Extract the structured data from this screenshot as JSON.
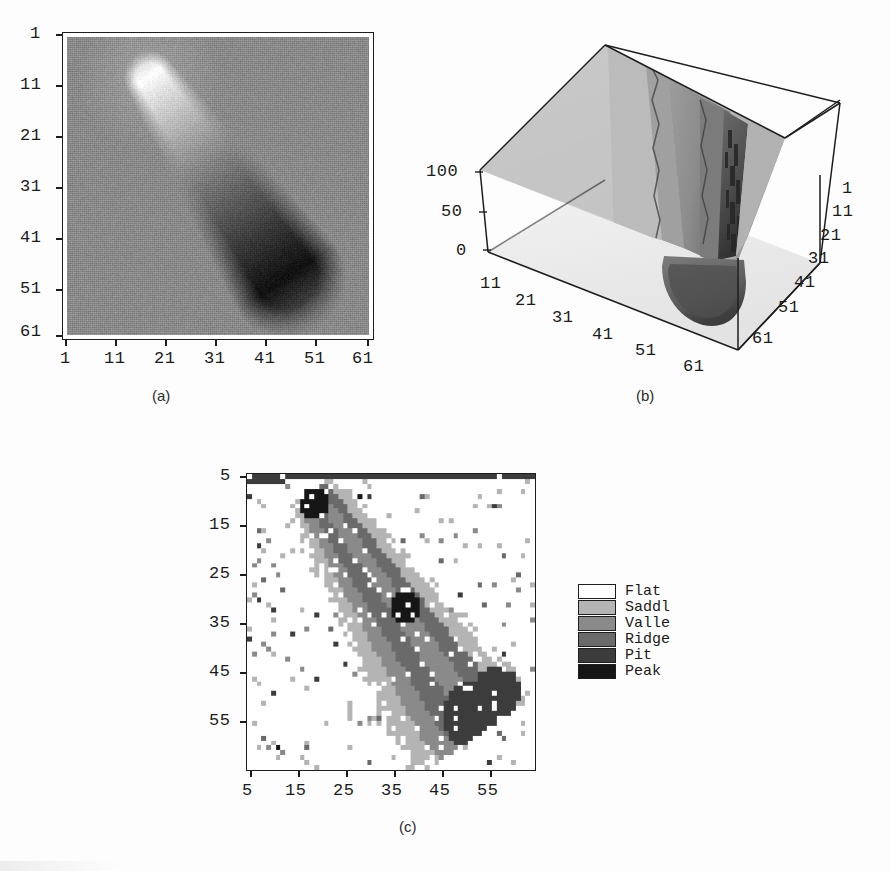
{
  "figure": {
    "background_color": "#fdfdfd",
    "panels": [
      {
        "id": "a",
        "caption": "(a)"
      },
      {
        "id": "b",
        "caption": "(b)"
      },
      {
        "id": "c",
        "caption": "(c)"
      }
    ]
  },
  "panel_a": {
    "caption": "(a)",
    "type": "grayscale-image",
    "x_ticks": [
      "1",
      "11",
      "21",
      "31",
      "41",
      "51",
      "61"
    ],
    "y_ticks": [
      "1",
      "11",
      "21",
      "31",
      "41",
      "51",
      "61"
    ],
    "x_range": [
      1,
      61
    ],
    "y_range": [
      1,
      61
    ],
    "background_gray": "#8b8b8b",
    "description": "Grayscale intensity image of an elongated object running from upper-left (bright peak) to lower-right (dark tail)"
  },
  "panel_b": {
    "caption": "(b)",
    "type": "surface-3d",
    "z_ticks": [
      "100",
      "50",
      "0"
    ],
    "z_range": [
      0,
      100
    ],
    "x_ticks": [
      "11",
      "21",
      "31",
      "41",
      "51",
      "61"
    ],
    "y_ticks": [
      "1",
      "11",
      "21",
      "31",
      "41",
      "51",
      "61"
    ],
    "x_range": [
      1,
      61
    ],
    "y_range": [
      1,
      61
    ],
    "description": "3D mesh surface plot of the same intensity data, showing a tall ridge and a deep pit"
  },
  "panel_c": {
    "caption": "(c)",
    "type": "classification-map",
    "x_ticks": [
      "5",
      "15",
      "25",
      "35",
      "45",
      "55"
    ],
    "y_ticks": [
      "5",
      "15",
      "25",
      "35",
      "45",
      "55"
    ],
    "x_range": [
      1,
      61
    ],
    "y_range": [
      1,
      61
    ],
    "legend": {
      "items": [
        {
          "label": "Flat",
          "color": "#ffffff"
        },
        {
          "label": "Saddl",
          "color": "#b4b4b4"
        },
        {
          "label": "Valle",
          "color": "#8a8a8a"
        },
        {
          "label": "Ridge",
          "color": "#6a6a6a"
        },
        {
          "label": "Pit",
          "color": "#3c3c3c"
        },
        {
          "label": "Peak",
          "color": "#161616"
        }
      ]
    },
    "description": "Topographic label map classifying every pixel as Flat, Saddle, Valley, Ridge, Pit or Peak"
  },
  "chart_data": [
    {
      "type": "heatmap",
      "panel": "a",
      "title": "(a)",
      "xlabel": "",
      "ylabel": "",
      "xticks": [
        1,
        11,
        21,
        31,
        41,
        51,
        61
      ],
      "yticks": [
        1,
        11,
        21,
        31,
        41,
        51,
        61
      ],
      "xlim": [
        1,
        61
      ],
      "ylim": [
        1,
        61
      ],
      "grid": false,
      "legend": "none",
      "colormap": "gray",
      "notes": "Background uniform mid-gray ~ value 50; bright blob (value ~100) centred near (18,8); dark elongated tail (value ~0-20) extending to (50,50)"
    },
    {
      "type": "area",
      "panel": "b",
      "title": "(b)",
      "xlabel": "",
      "ylabel": "",
      "zlabel": "",
      "xticks": [
        11,
        21,
        31,
        41,
        51,
        61
      ],
      "yticks": [
        1,
        11,
        21,
        31,
        41,
        51,
        61
      ],
      "zticks": [
        0,
        50,
        100
      ],
      "xlim": [
        1,
        61
      ],
      "ylim": [
        1,
        61
      ],
      "zlim": [
        0,
        100
      ],
      "grid": false,
      "legend": "none",
      "notes": "3D surface of the intensity field in (a): flat plateau at z~50, a sharp ridge rising toward z~100 along the diagonal, and a deep pit dropping toward z~0 at the lower right"
    },
    {
      "type": "heatmap",
      "panel": "c",
      "title": "(c)",
      "xlabel": "",
      "ylabel": "",
      "xticks": [
        5,
        15,
        25,
        35,
        45,
        55
      ],
      "yticks": [
        5,
        15,
        25,
        35,
        45,
        55
      ],
      "xlim": [
        1,
        61
      ],
      "ylim": [
        1,
        61
      ],
      "grid": false,
      "legend": "right",
      "categories": [
        "Flat",
        "Saddl",
        "Valle",
        "Ridge",
        "Pit",
        "Peak"
      ],
      "category_colors": [
        "#ffffff",
        "#b4b4b4",
        "#8a8a8a",
        "#6a6a6a",
        "#3c3c3c",
        "#161616"
      ],
      "notes": "Per-pixel topographic classification; diagonal bands of Ridge and Valley with Saddle borders, Peak clusters near (15,7) and (33,28), Pit region near (50,48), remainder mostly Flat"
    }
  ]
}
